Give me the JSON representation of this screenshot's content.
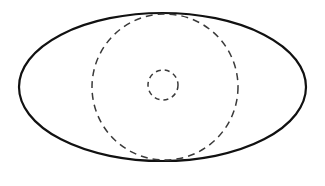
{
  "canvas": {
    "width": 325,
    "height": 186,
    "background_color": "#ffffff",
    "title": "Concentric ellipse with dashed circles"
  },
  "palette": {
    "stroke_color": "#111111",
    "dashed_stroke_color": "#3a3a3a",
    "fill_color": "none",
    "background_color": "#ffffff"
  },
  "chart_data": {
    "type": "diagram",
    "title": "",
    "xlabel": "",
    "ylabel": "",
    "grid": false,
    "legend": false,
    "shapes": [
      {
        "name": "outer-ellipse",
        "kind": "ellipse",
        "cx": 162.5,
        "cy": 87,
        "rx": 143.5,
        "ry": 74,
        "stroke": "#111111",
        "stroke_width": 2.2,
        "fill": "none",
        "dash": "none"
      },
      {
        "name": "middle-dashed-circle",
        "kind": "circle",
        "cx": 165,
        "cy": 87,
        "r": 73,
        "stroke": "#3a3a3a",
        "stroke_width": 1.5,
        "fill": "none",
        "dash": "7,5"
      },
      {
        "name": "inner-dashed-circle",
        "kind": "circle",
        "cx": 163,
        "cy": 85,
        "r": 15,
        "stroke": "#3a3a3a",
        "stroke_width": 1.5,
        "fill": "none",
        "dash": "5,4"
      }
    ]
  },
  "labels": {
    "outer": "",
    "middle": "",
    "inner": ""
  }
}
